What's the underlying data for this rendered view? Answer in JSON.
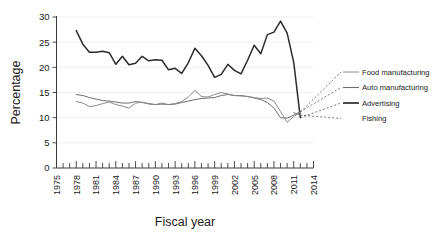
{
  "chart_data": {
    "type": "line",
    "title": "",
    "xlabel": "Fiscal year",
    "ylabel": "Percentage",
    "xlim": [
      1975,
      2014
    ],
    "ylim": [
      0,
      30
    ],
    "yticks": [
      0,
      5,
      10,
      15,
      20,
      25,
      30
    ],
    "xticks": [
      1975,
      1978,
      1981,
      1984,
      1987,
      1990,
      1993,
      1996,
      1999,
      2002,
      2005,
      2008,
      2011,
      2014
    ],
    "x_minor_tick_interval": 1,
    "grid": true,
    "legend_position": "right",
    "x": [
      1978,
      1979,
      1980,
      1981,
      1982,
      1983,
      1984,
      1985,
      1986,
      1987,
      1988,
      1989,
      1990,
      1991,
      1992,
      1993,
      1994,
      1995,
      1996,
      1997,
      1998,
      1999,
      2000,
      2001,
      2002,
      2003,
      2004,
      2005,
      2006,
      2007,
      2008,
      2009,
      2010,
      2011,
      2012
    ],
    "series": [
      {
        "name": "Advertising",
        "color": "#2b2b2b",
        "width": 1.5,
        "values": [
          27.3,
          24.6,
          23.0,
          23.0,
          23.2,
          22.9,
          20.6,
          22.2,
          20.5,
          20.8,
          22.2,
          21.3,
          21.5,
          21.4,
          19.5,
          19.8,
          18.8,
          20.9,
          23.8,
          22.3,
          20.4,
          18.0,
          18.6,
          20.6,
          19.4,
          18.7,
          21.4,
          24.4,
          22.7,
          26.5,
          27.0,
          29.2,
          26.8,
          21.0,
          10.0
        ]
      },
      {
        "name": "Auto manufacturing",
        "color": "#6e6e6e",
        "width": 1.0,
        "values": [
          14.6,
          14.4,
          14.0,
          13.7,
          13.4,
          13.3,
          13.1,
          12.9,
          12.9,
          13.2,
          13.0,
          12.8,
          12.6,
          12.7,
          12.6,
          12.7,
          13.0,
          13.3,
          13.6,
          13.8,
          13.9,
          14.0,
          14.4,
          14.6,
          14.4,
          14.4,
          14.2,
          13.9,
          13.6,
          13.0,
          11.9,
          10.0,
          9.9,
          10.5,
          11.2
        ]
      },
      {
        "name": "Food manufacturing",
        "color": "#8a8a8a",
        "width": 1.0,
        "values": [
          13.2,
          12.9,
          12.2,
          12.4,
          12.8,
          13.1,
          12.6,
          12.3,
          11.9,
          12.9,
          13.1,
          12.7,
          12.6,
          12.9,
          12.6,
          12.8,
          13.2,
          14.1,
          15.4,
          14.2,
          14.1,
          14.6,
          15.0,
          14.7,
          14.4,
          14.3,
          14.2,
          14.0,
          13.8,
          13.9,
          13.3,
          11.2,
          9.1,
          10.2,
          11.1
        ]
      },
      {
        "name": "Fishing",
        "color": "#7f7f7f",
        "width": 1.0,
        "values": [
          null,
          null,
          null,
          null,
          null,
          null,
          null,
          null,
          null,
          null,
          null,
          null,
          null,
          null,
          null,
          null,
          null,
          null,
          null,
          null,
          null,
          null,
          null,
          null,
          null,
          null,
          null,
          null,
          null,
          null,
          null,
          null,
          null,
          11.0,
          10.5
        ]
      }
    ],
    "legend_entries": [
      {
        "label": "Food manufacturing",
        "color": "#8a8a8a",
        "width": 1.0
      },
      {
        "label": "Auto manufacturing",
        "color": "#6e6e6e",
        "width": 1.1
      },
      {
        "label": "Advertising",
        "color": "#2b2b2b",
        "width": 1.7
      },
      {
        "label": "Fishing",
        "color": "#7f7f7f",
        "width": 0.0
      }
    ],
    "leader_lines": true
  }
}
